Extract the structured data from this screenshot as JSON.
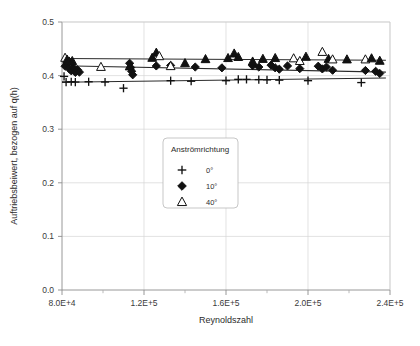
{
  "chart_data": {
    "type": "scatter",
    "title": "",
    "xlabel": "Reynoldszahl",
    "ylabel": "Auftriebsbeiwert, bezogen auf q(h)",
    "xlim": [
      80000,
      240000
    ],
    "ylim": [
      0.0,
      0.5
    ],
    "xticks": [
      80000,
      120000,
      160000,
      200000,
      240000
    ],
    "xtick_labels": [
      "8.0E+4",
      "1.2E+5",
      "1.6E+5",
      "2.0E+5",
      "2.4E+5"
    ],
    "yticks": [
      0.0,
      0.1,
      0.2,
      0.3,
      0.4,
      0.5
    ],
    "ytick_labels": [
      "0.0",
      "0.1",
      "0.2",
      "0.3",
      "0.4",
      "0.5"
    ],
    "grid": true,
    "minor_xticks": true,
    "legend": {
      "title": "Anströmrichtung",
      "position": "center",
      "entries": [
        {
          "label": "0°",
          "marker": "plus",
          "fill": "none",
          "color": "#111111"
        },
        {
          "label": "10°",
          "marker": "diamond",
          "fill": "solid",
          "color": "#111111"
        },
        {
          "label": "40°",
          "marker": "triangle",
          "fill": "none",
          "color": "#111111"
        }
      ]
    },
    "series": [
      {
        "name": "0°",
        "marker": "plus",
        "color": "#111111",
        "trendline": {
          "x0": 80000,
          "y0": 0.3875,
          "x1": 238000,
          "y1": 0.3955
        },
        "points": [
          [
            81000,
            0.3985
          ],
          [
            82000,
            0.388
          ],
          [
            84500,
            0.3885
          ],
          [
            86500,
            0.388
          ],
          [
            93000,
            0.3885
          ],
          [
            101000,
            0.388
          ],
          [
            110000,
            0.3765
          ],
          [
            133000,
            0.3905
          ],
          [
            143000,
            0.3895
          ],
          [
            160000,
            0.3905
          ],
          [
            166000,
            0.393
          ],
          [
            170000,
            0.393
          ],
          [
            176000,
            0.3925
          ],
          [
            180000,
            0.392
          ],
          [
            186000,
            0.3915
          ],
          [
            200000,
            0.3905
          ],
          [
            226000,
            0.387
          ]
        ]
      },
      {
        "name": "10°",
        "marker": "diamond",
        "color": "#111111",
        "trendline": {
          "x0": 80000,
          "y0": 0.4185,
          "x1": 238000,
          "y1": 0.4065
        },
        "points": [
          [
            81500,
            0.4175
          ],
          [
            82500,
            0.4225
          ],
          [
            83500,
            0.413
          ],
          [
            84500,
            0.409
          ],
          [
            85500,
            0.4145
          ],
          [
            86500,
            0.406
          ],
          [
            87500,
            0.411
          ],
          [
            88500,
            0.4065
          ],
          [
            113000,
            0.423
          ],
          [
            113500,
            0.415
          ],
          [
            114000,
            0.408
          ],
          [
            114500,
            0.4015
          ],
          [
            126000,
            0.418
          ],
          [
            133000,
            0.419
          ],
          [
            145000,
            0.416
          ],
          [
            158000,
            0.4145
          ],
          [
            173000,
            0.4185
          ],
          [
            176000,
            0.416
          ],
          [
            182000,
            0.4195
          ],
          [
            184000,
            0.4145
          ],
          [
            186000,
            0.412
          ],
          [
            190000,
            0.418
          ],
          [
            196000,
            0.413
          ],
          [
            205000,
            0.4175
          ],
          [
            207000,
            0.4125
          ],
          [
            209000,
            0.416
          ],
          [
            212000,
            0.41
          ],
          [
            228000,
            0.4095
          ],
          [
            233000,
            0.408
          ],
          [
            235000,
            0.404
          ]
        ]
      },
      {
        "name": "40°",
        "marker": "triangle",
        "color": "#111111",
        "trendline": {
          "x0": 80000,
          "y0": 0.432,
          "x1": 238000,
          "y1": 0.4285
        },
        "points": [
          [
            81500,
            0.433
          ],
          [
            82500,
            0.4295
          ],
          [
            83500,
            0.426
          ],
          [
            85000,
            0.427
          ],
          [
            99000,
            0.416
          ],
          [
            113000,
            0.417
          ],
          [
            124000,
            0.433
          ],
          [
            126000,
            0.4425
          ],
          [
            127500,
            0.436
          ],
          [
            133000,
            0.4175
          ],
          [
            140000,
            0.423
          ],
          [
            150000,
            0.4305
          ],
          [
            161000,
            0.4325
          ],
          [
            164000,
            0.441
          ],
          [
            166000,
            0.4345
          ],
          [
            173000,
            0.426
          ],
          [
            178000,
            0.431
          ],
          [
            184000,
            0.4325
          ],
          [
            193000,
            0.432
          ],
          [
            196000,
            0.427
          ],
          [
            199000,
            0.435
          ],
          [
            207000,
            0.444
          ],
          [
            210000,
            0.431
          ],
          [
            212000,
            0.43
          ],
          [
            219000,
            0.43
          ],
          [
            228000,
            0.43
          ],
          [
            231000,
            0.432
          ],
          [
            235000,
            0.4275
          ]
        ]
      }
    ]
  }
}
